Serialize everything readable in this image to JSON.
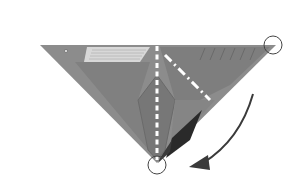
{
  "diagram": {
    "type": "origami-fold-step",
    "colors": {
      "background": "#ffffff",
      "paper": "#8c8c8c",
      "paper_dark": "#6e6e6e",
      "paper_mid": "#7b7b7b",
      "paper_light": "#d8d8d8",
      "flap_shadow": "#2a2a2a",
      "fold_line": "#ffffff",
      "marker_circle": "#444444",
      "arrow": "#3a3a3a"
    },
    "shapes": {
      "paper_triangle": {
        "points": [
          [
            40,
            45
          ],
          [
            276,
            45
          ],
          [
            157,
            163
          ]
        ]
      },
      "label_panel": {
        "points": [
          [
            85,
            47
          ],
          [
            150,
            47
          ],
          [
            140,
            62
          ],
          [
            82,
            62
          ]
        ]
      },
      "dark_flap": {
        "points": [
          [
            170,
            140
          ],
          [
            200,
            112
          ],
          [
            188,
            143
          ],
          [
            165,
            158
          ]
        ]
      },
      "inner_diamond": {
        "points": [
          [
            157,
            75
          ],
          [
            175,
            100
          ],
          [
            165,
            150
          ],
          [
            157,
            160
          ],
          [
            148,
            150
          ],
          [
            138,
            100
          ]
        ]
      }
    },
    "fold_lines": [
      {
        "kind": "valley",
        "style": "dashed",
        "from": [
          157,
          45
        ],
        "to": [
          157,
          158
        ]
      },
      {
        "kind": "mountain",
        "style": "dash-dot",
        "from": [
          165,
          52
        ],
        "to": [
          210,
          102
        ]
      }
    ],
    "markers": [
      {
        "name": "corner-circle",
        "cx": 273,
        "cy": 45,
        "r": 9
      },
      {
        "name": "tip-circle",
        "cx": 157,
        "cy": 165,
        "r": 9
      }
    ],
    "arrow": {
      "start": [
        253,
        93
      ],
      "control": [
        240,
        145
      ],
      "end": [
        195,
        166
      ],
      "direction": "counter-clockwise-down-left"
    },
    "caption": ""
  }
}
